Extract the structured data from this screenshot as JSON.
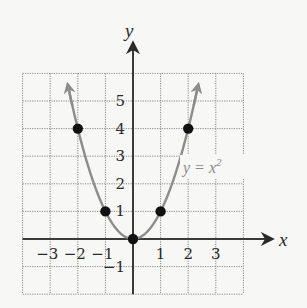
{
  "chart_data": {
    "type": "line",
    "title": "",
    "function": "y = x^2",
    "curve_label": "y = x",
    "curve_label_exponent": "2",
    "xlabel": "x",
    "ylabel": "y",
    "xlim": [
      -4,
      4
    ],
    "ylim": [
      -2,
      6
    ],
    "grid": true,
    "x_ticks": [
      -3,
      -2,
      -1,
      1,
      2,
      3
    ],
    "x_tick_labels": [
      "−3",
      "−2",
      "−1",
      "1",
      "2",
      "3"
    ],
    "y_ticks": [
      -1,
      1,
      2,
      3,
      4,
      5
    ],
    "y_tick_labels": [
      "−1",
      "1",
      "2",
      "3",
      "4",
      "5"
    ],
    "series": [
      {
        "name": "y = x^2",
        "color": "#8c8c8c",
        "points": [
          {
            "x": -2,
            "y": 4
          },
          {
            "x": -1,
            "y": 1
          },
          {
            "x": 0,
            "y": 0
          },
          {
            "x": 1,
            "y": 1
          },
          {
            "x": 2,
            "y": 4
          }
        ]
      }
    ],
    "curve_arrows": true
  },
  "colors": {
    "axis": "#3a3a3a",
    "grid": "#8a8a8a",
    "curve": "#8c8c8c",
    "points": "#111111",
    "background": "#f7f7f5"
  }
}
